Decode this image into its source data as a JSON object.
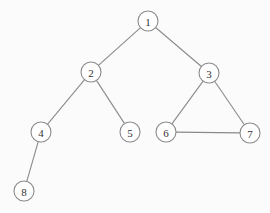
{
  "graph": {
    "type": "undirected",
    "nodes": [
      {
        "id": "1",
        "label": "1"
      },
      {
        "id": "2",
        "label": "2"
      },
      {
        "id": "3",
        "label": "3"
      },
      {
        "id": "4",
        "label": "4"
      },
      {
        "id": "5",
        "label": "5"
      },
      {
        "id": "6",
        "label": "6"
      },
      {
        "id": "7",
        "label": "7"
      },
      {
        "id": "8",
        "label": "8"
      }
    ],
    "edges": [
      {
        "from": "1",
        "to": "2"
      },
      {
        "from": "1",
        "to": "3"
      },
      {
        "from": "2",
        "to": "4"
      },
      {
        "from": "2",
        "to": "5"
      },
      {
        "from": "3",
        "to": "6"
      },
      {
        "from": "3",
        "to": "7"
      },
      {
        "from": "6",
        "to": "7"
      },
      {
        "from": "4",
        "to": "8"
      }
    ]
  }
}
